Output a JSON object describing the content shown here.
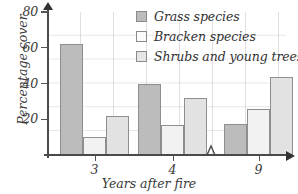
{
  "chart_data": {
    "type": "bar",
    "title": "",
    "xlabel": "Years after fire",
    "ylabel": "Percentage cover",
    "categories": [
      "3",
      "4",
      "9"
    ],
    "ylim": [
      0,
      80
    ],
    "yticks": [
      20,
      40,
      60,
      80
    ],
    "grid": true,
    "axis_break": true,
    "axis_break_between": [
      "4",
      "9"
    ],
    "legend_position": "top-right",
    "series": [
      {
        "name": "Grass species",
        "color": "#bcbcbc",
        "values": [
          62,
          40,
          17.5
        ]
      },
      {
        "name": "Bracken species",
        "color": "#f2f2f2",
        "values": [
          10,
          17,
          26
        ]
      },
      {
        "name": "Shrubs and young trees",
        "color": "#e2e2e2",
        "values": [
          22,
          32,
          43.5
        ]
      }
    ]
  },
  "axes": {
    "y_title": "Percentage cover",
    "x_title": "Years after fire",
    "y_ticks": [
      "20",
      "40",
      "60",
      "80"
    ],
    "x_ticks": [
      "3",
      "4",
      "9"
    ]
  },
  "legend": {
    "items": [
      {
        "label": "Grass species"
      },
      {
        "label": "Bracken species"
      },
      {
        "label": "Shrubs and young trees"
      }
    ]
  }
}
